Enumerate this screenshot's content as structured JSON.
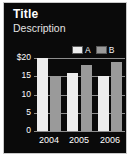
{
  "header": {
    "title": "Title",
    "description": "Description"
  },
  "legend": {
    "position": "top-right",
    "entries": [
      {
        "label": "A",
        "color": "#ededed",
        "icon": "legend-swatch-a"
      },
      {
        "label": "B",
        "color": "#9a9a9a",
        "icon": "legend-swatch-b"
      }
    ]
  },
  "axis": {
    "y_ticks": [
      "$20",
      "15",
      "10",
      "5",
      "0"
    ],
    "y_values": [
      20,
      15,
      10,
      5,
      0
    ],
    "x_ticks": [
      "2004",
      "2005",
      "2006"
    ]
  },
  "colors": {
    "panel_background": "#0a0a0a",
    "panel_border": "#c9c9c9",
    "gridline": "#8e8e8e",
    "text": "#ffffff",
    "series_a": "#ededed",
    "series_b": "#9a9a9a"
  },
  "chart_data": {
    "type": "bar",
    "title": "Title",
    "subtitle": "Description",
    "xlabel": "",
    "ylabel": "",
    "categories": [
      "2004",
      "2005",
      "2006"
    ],
    "series": [
      {
        "name": "A",
        "values": [
          20,
          16,
          15
        ],
        "color": "#ededed"
      },
      {
        "name": "B",
        "values": [
          15,
          18,
          19
        ],
        "color": "#9a9a9a"
      }
    ],
    "ylim": [
      0,
      20
    ],
    "yticks": [
      0,
      5,
      10,
      15,
      20
    ],
    "ytick_labels": [
      "0",
      "5",
      "10",
      "15",
      "$20"
    ],
    "grid": true,
    "legend_position": "top-right"
  }
}
